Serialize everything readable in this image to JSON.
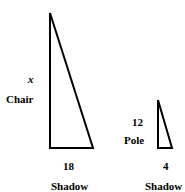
{
  "diagram": {
    "large_triangle": {
      "height_var": "x",
      "height_label": "Chair",
      "base_value": "18",
      "base_label": "Shadow"
    },
    "small_triangle": {
      "height_value": "12",
      "height_label": "Pole",
      "base_value": "4",
      "base_label": "Shadow"
    },
    "stroke_color": "#000000"
  }
}
